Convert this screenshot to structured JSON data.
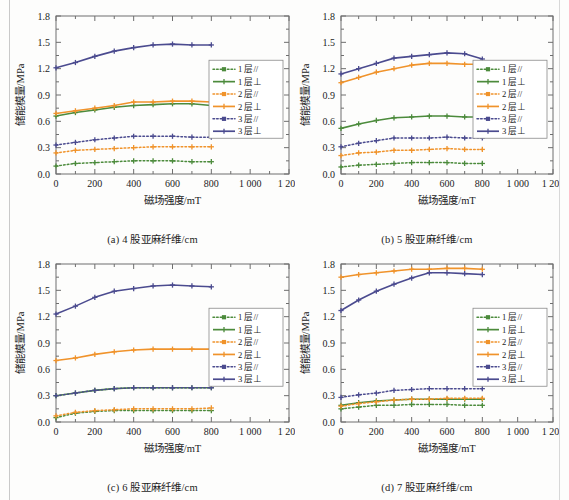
{
  "figure": {
    "axis": {
      "xlabel": "磁场强度/mT",
      "ylabel": "储能模量/MPa",
      "xticks": [
        "0",
        "200",
        "400",
        "600",
        "800",
        "1 000",
        "1 200"
      ],
      "xtick_values": [
        0,
        200,
        400,
        600,
        800,
        1000,
        1200
      ],
      "yticks": [
        "0.0",
        "0.3",
        "0.6",
        "0.9",
        "1.2",
        "1.5",
        "1.8"
      ],
      "ytick_values": [
        0.0,
        0.3,
        0.6,
        0.9,
        1.2,
        1.5,
        1.8
      ],
      "xlim": [
        0,
        1200
      ],
      "ylim": [
        0,
        1.8
      ],
      "grid": false
    },
    "legend": {
      "position": "center-right",
      "entries": [
        {
          "label": "1 层//",
          "color": "#4c8b3c",
          "style": "dotted",
          "marker": "square"
        },
        {
          "label": "1 层⊥",
          "color": "#4c8b3c",
          "style": "solid",
          "marker": "cross"
        },
        {
          "label": "2 层//",
          "color": "#f0932b",
          "style": "dotted",
          "marker": "square"
        },
        {
          "label": "2 层⊥",
          "color": "#f0932b",
          "style": "solid",
          "marker": "cross"
        },
        {
          "label": "3 层//",
          "color": "#4b4b8f",
          "style": "dotted",
          "marker": "square"
        },
        {
          "label": "3 层⊥",
          "color": "#4b4b8f",
          "style": "solid",
          "marker": "cross"
        }
      ]
    },
    "colors": {
      "series_1": "#4c8b3c",
      "series_2": "#f0932b",
      "series_3": "#4b4b8f",
      "frame": "#6e6e6e",
      "background": "#ffffff"
    }
  },
  "chart_data": [
    {
      "type": "line",
      "panel": "a",
      "title": "(a) 4 股亚麻纤维/cm",
      "xlabel": "磁场强度/mT",
      "ylabel": "储能模量/MPa",
      "xlim": [
        0,
        1200
      ],
      "ylim": [
        0,
        1.8
      ],
      "x": [
        0,
        100,
        200,
        300,
        400,
        500,
        600,
        700,
        800
      ],
      "series": [
        {
          "name": "1 层//",
          "color": "#4c8b3c",
          "style": "dotted",
          "values": [
            0.09,
            0.12,
            0.13,
            0.14,
            0.15,
            0.15,
            0.15,
            0.14,
            0.14
          ]
        },
        {
          "name": "1 层⊥",
          "color": "#4c8b3c",
          "style": "solid",
          "values": [
            0.66,
            0.7,
            0.73,
            0.76,
            0.78,
            0.79,
            0.8,
            0.8,
            0.78
          ]
        },
        {
          "name": "2 层//",
          "color": "#f0932b",
          "style": "dotted",
          "values": [
            0.24,
            0.27,
            0.28,
            0.29,
            0.3,
            0.31,
            0.31,
            0.31,
            0.31
          ]
        },
        {
          "name": "2 层⊥",
          "color": "#f0932b",
          "style": "solid",
          "values": [
            0.69,
            0.72,
            0.75,
            0.78,
            0.82,
            0.82,
            0.83,
            0.83,
            0.82
          ]
        },
        {
          "name": "3 层//",
          "color": "#4b4b8f",
          "style": "dotted",
          "values": [
            0.33,
            0.36,
            0.39,
            0.41,
            0.43,
            0.43,
            0.43,
            0.42,
            0.42
          ]
        },
        {
          "name": "3 层⊥",
          "color": "#4b4b8f",
          "style": "solid",
          "values": [
            1.21,
            1.27,
            1.34,
            1.4,
            1.44,
            1.47,
            1.48,
            1.47,
            1.47
          ]
        }
      ]
    },
    {
      "type": "line",
      "panel": "b",
      "title": "(b) 5 股亚麻纤维/cm",
      "xlabel": "磁场强度/mT",
      "ylabel": "储能模量/MPa",
      "xlim": [
        0,
        1200
      ],
      "ylim": [
        0,
        1.8
      ],
      "x": [
        0,
        100,
        200,
        300,
        400,
        500,
        600,
        700,
        800
      ],
      "series": [
        {
          "name": "1 层//",
          "color": "#4c8b3c",
          "style": "dotted",
          "values": [
            0.08,
            0.1,
            0.11,
            0.12,
            0.13,
            0.13,
            0.13,
            0.12,
            0.12
          ]
        },
        {
          "name": "1 层⊥",
          "color": "#4c8b3c",
          "style": "solid",
          "values": [
            0.52,
            0.57,
            0.61,
            0.64,
            0.65,
            0.66,
            0.66,
            0.65,
            0.65
          ]
        },
        {
          "name": "2 层//",
          "color": "#f0932b",
          "style": "dotted",
          "values": [
            0.21,
            0.24,
            0.25,
            0.27,
            0.27,
            0.28,
            0.29,
            0.28,
            0.28
          ]
        },
        {
          "name": "2 层⊥",
          "color": "#f0932b",
          "style": "solid",
          "values": [
            1.04,
            1.1,
            1.16,
            1.2,
            1.24,
            1.26,
            1.26,
            1.25,
            1.25
          ]
        },
        {
          "name": "3 层//",
          "color": "#4b4b8f",
          "style": "dotted",
          "values": [
            0.31,
            0.35,
            0.38,
            0.41,
            0.41,
            0.41,
            0.42,
            0.41,
            0.41
          ]
        },
        {
          "name": "3 层⊥",
          "color": "#4b4b8f",
          "style": "solid",
          "values": [
            1.14,
            1.2,
            1.26,
            1.32,
            1.34,
            1.36,
            1.38,
            1.37,
            1.31
          ]
        }
      ]
    },
    {
      "type": "line",
      "panel": "c",
      "title": "(c) 6 股亚麻纤维/cm",
      "xlabel": "磁场强度/mT",
      "ylabel": "储能模量/MPa",
      "xlim": [
        0,
        1200
      ],
      "ylim": [
        0,
        1.8
      ],
      "x": [
        0,
        100,
        200,
        300,
        400,
        500,
        600,
        700,
        800
      ],
      "series": [
        {
          "name": "1 层//",
          "color": "#4c8b3c",
          "style": "dotted",
          "values": [
            0.05,
            0.1,
            0.12,
            0.13,
            0.13,
            0.13,
            0.13,
            0.13,
            0.13
          ]
        },
        {
          "name": "1 层⊥",
          "color": "#4c8b3c",
          "style": "solid",
          "values": [
            0.3,
            0.33,
            0.36,
            0.38,
            0.39,
            0.39,
            0.39,
            0.39,
            0.39
          ]
        },
        {
          "name": "2 层//",
          "color": "#f0932b",
          "style": "dotted",
          "values": [
            0.07,
            0.11,
            0.13,
            0.14,
            0.15,
            0.15,
            0.15,
            0.15,
            0.16
          ]
        },
        {
          "name": "2 层⊥",
          "color": "#f0932b",
          "style": "solid",
          "values": [
            0.7,
            0.73,
            0.77,
            0.8,
            0.82,
            0.83,
            0.83,
            0.83,
            0.83
          ]
        },
        {
          "name": "3 层//",
          "color": "#4b4b8f",
          "style": "dotted",
          "values": [
            0.3,
            0.33,
            0.36,
            0.38,
            0.39,
            0.39,
            0.39,
            0.39,
            0.39
          ]
        },
        {
          "name": "3 层⊥",
          "color": "#4b4b8f",
          "style": "solid",
          "values": [
            1.23,
            1.32,
            1.42,
            1.49,
            1.52,
            1.55,
            1.56,
            1.55,
            1.54
          ]
        }
      ]
    },
    {
      "type": "line",
      "panel": "d",
      "title": "(d) 7 股亚麻纤维/cm",
      "xlabel": "磁场强度/mT",
      "ylabel": "储能模量/MPa",
      "xlim": [
        0,
        1200
      ],
      "ylim": [
        0,
        1.8
      ],
      "x": [
        0,
        100,
        200,
        300,
        400,
        500,
        600,
        700,
        800
      ],
      "series": [
        {
          "name": "1 层//",
          "color": "#4c8b3c",
          "style": "dotted",
          "values": [
            0.15,
            0.17,
            0.19,
            0.19,
            0.2,
            0.2,
            0.2,
            0.19,
            0.19
          ]
        },
        {
          "name": "1 层⊥",
          "color": "#4c8b3c",
          "style": "solid",
          "values": [
            0.19,
            0.22,
            0.24,
            0.25,
            0.26,
            0.26,
            0.26,
            0.26,
            0.26
          ]
        },
        {
          "name": "2 层//",
          "color": "#f0932b",
          "style": "dotted",
          "values": [
            0.18,
            0.21,
            0.23,
            0.25,
            0.26,
            0.26,
            0.27,
            0.27,
            0.27
          ]
        },
        {
          "name": "2 层⊥",
          "color": "#f0932b",
          "style": "solid",
          "values": [
            1.65,
            1.68,
            1.7,
            1.72,
            1.74,
            1.74,
            1.75,
            1.75,
            1.74
          ]
        },
        {
          "name": "3 层//",
          "color": "#4b4b8f",
          "style": "dotted",
          "values": [
            0.28,
            0.31,
            0.33,
            0.36,
            0.37,
            0.38,
            0.38,
            0.38,
            0.38
          ]
        },
        {
          "name": "3 层⊥",
          "color": "#4b4b8f",
          "style": "solid",
          "values": [
            1.27,
            1.39,
            1.49,
            1.57,
            1.64,
            1.7,
            1.7,
            1.69,
            1.68
          ]
        }
      ]
    }
  ]
}
